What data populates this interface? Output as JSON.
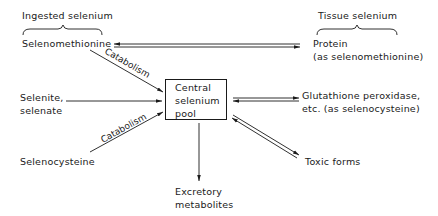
{
  "diagram": {
    "type": "flow",
    "groups": {
      "ingested": "Ingested selenium",
      "tissue": "Tissue selenium"
    },
    "sources": {
      "selenomethionine": "Selenomethionine",
      "selenite_line1": "Selenite,",
      "selenite_line2": "selenate",
      "selenocysteine": "Selenocysteine"
    },
    "center": {
      "line1": "Central",
      "line2": "selenium",
      "line3": "pool"
    },
    "edges": {
      "catabolism_top": "Catabolism",
      "catabolism_bottom": "Catabolism"
    },
    "targets": {
      "protein_line1": "Protein",
      "protein_line2": "(as selenomethionine)",
      "gpx_line1": "Glutathione peroxidase,",
      "gpx_line2": "etc. (as selenocysteine)",
      "toxic": "Toxic forms",
      "excretory_line1": "Excretory",
      "excretory_line2": "metabolites"
    },
    "connections": [
      {
        "from": "Selenomethionine",
        "to": "Protein (as selenomethionine)",
        "kind": "reversible"
      },
      {
        "from": "Selenomethionine",
        "to": "Central selenium pool",
        "kind": "one-way",
        "label": "Catabolism"
      },
      {
        "from": "Selenite, selenate",
        "to": "Central selenium pool",
        "kind": "one-way"
      },
      {
        "from": "Selenocysteine",
        "to": "Central selenium pool",
        "kind": "one-way",
        "label": "Catabolism"
      },
      {
        "from": "Central selenium pool",
        "to": "Glutathione peroxidase, etc. (as selenocysteine)",
        "kind": "reversible"
      },
      {
        "from": "Central selenium pool",
        "to": "Toxic forms",
        "kind": "reversible"
      },
      {
        "from": "Central selenium pool",
        "to": "Excretory metabolites",
        "kind": "one-way"
      }
    ]
  },
  "colors": {
    "ink": "#1a1a1a",
    "background": "#ffffff"
  }
}
